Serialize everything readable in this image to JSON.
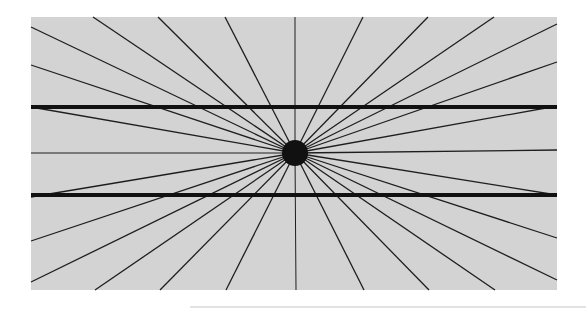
{
  "figure": {
    "background": "#d3d3d3",
    "line_color": "#1e1e1e",
    "center": {
      "x": 295,
      "y": 153,
      "radius": 13
    },
    "panel": {
      "x": 31,
      "y": 17,
      "width": 526,
      "height": 273
    },
    "thick_lines": [
      {
        "y": 107,
        "width": 4
      },
      {
        "y": 195,
        "width": 4
      }
    ],
    "ray_endpoints": [
      [
        93,
        17
      ],
      [
        158,
        17
      ],
      [
        225,
        17
      ],
      [
        295,
        17
      ],
      [
        363,
        17
      ],
      [
        428,
        17
      ],
      [
        494,
        17
      ],
      [
        557,
        24
      ],
      [
        557,
        62
      ],
      [
        557,
        106
      ],
      [
        557,
        150
      ],
      [
        557,
        195
      ],
      [
        557,
        238
      ],
      [
        557,
        280
      ],
      [
        495,
        290
      ],
      [
        429,
        290
      ],
      [
        364,
        290
      ],
      [
        296,
        290
      ],
      [
        226,
        290
      ],
      [
        160,
        290
      ],
      [
        95,
        290
      ],
      [
        31,
        282
      ],
      [
        31,
        241
      ],
      [
        31,
        197
      ],
      [
        31,
        153
      ],
      [
        31,
        107
      ],
      [
        31,
        65
      ],
      [
        31,
        27
      ]
    ]
  }
}
